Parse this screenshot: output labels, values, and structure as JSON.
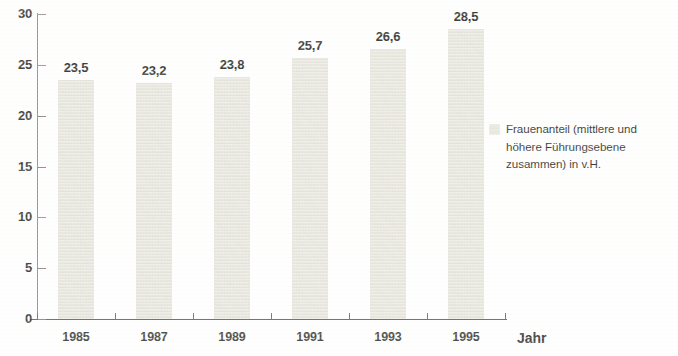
{
  "chart_data": {
    "type": "bar",
    "title": "",
    "subtitle": "",
    "xlabel": "Jahr",
    "ylabel": "",
    "categories": [
      "1985",
      "1987",
      "1989",
      "1991",
      "1993",
      "1995"
    ],
    "values": [
      23.5,
      23.2,
      23.8,
      25.7,
      26.6,
      28.5
    ],
    "value_labels": [
      "23,5",
      "23,2",
      "23,8",
      "25,7",
      "26,6",
      "28,5"
    ],
    "series": [
      {
        "name": "Frauenanteil (mittlere und höhere Führungsebene zusammen) in v.H.",
        "values": [
          23.5,
          23.2,
          23.8,
          25.7,
          26.6,
          28.5
        ],
        "color": "#e7e6dd"
      }
    ],
    "ylim": [
      0,
      30
    ],
    "y_ticks": [
      0,
      5,
      10,
      15,
      20,
      25,
      30
    ],
    "y_tick_labels": [
      "0",
      "5",
      "10",
      "15",
      "20",
      "25",
      "30"
    ],
    "grid": false,
    "legend_position": "right",
    "legend": [
      {
        "label": "Frauenanteil (mittlere und\nhöhere Führungsebene\nzusammen) in v.H.",
        "color": "#e7e6dd"
      }
    ],
    "axis_color": "#6e6d68",
    "background_color": "#ffffff",
    "bar_color": "#e7e6dd"
  }
}
